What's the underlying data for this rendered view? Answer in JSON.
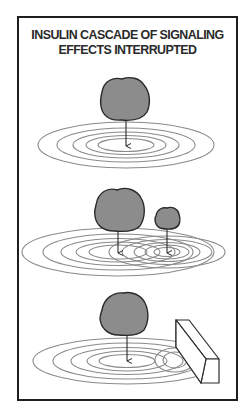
{
  "title": {
    "line1": "INSULIN CASCADE OF SIGNALING",
    "line2": "EFFECTS INTERRUPTED"
  },
  "panels": [
    {
      "name": "single-signal",
      "description": "One blob drops an arrow into concentric ripple rings"
    },
    {
      "name": "overlapping-signals",
      "description": "Large blob and small blob create overlapping ripple rings"
    },
    {
      "name": "interrupted-signal",
      "description": "Blob ripples hit a rectangular block barrier"
    }
  ],
  "colors": {
    "frame": "#1e1e1e",
    "blob_fill": "#8c8c8c",
    "blob_stroke": "#2a2a2a",
    "ripple": "#8a8a8a",
    "arrow": "#2a2a2a"
  }
}
